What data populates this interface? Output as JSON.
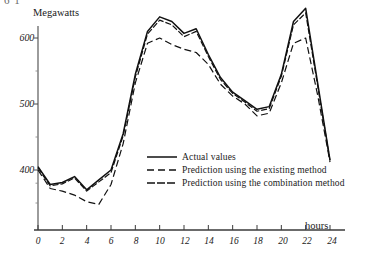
{
  "figure": {
    "crop_artifact_text": "6 1",
    "ylabel": "Megawatts",
    "xlabel": "hours",
    "yticks": [
      "600",
      "500",
      "400"
    ],
    "ytick_values": [
      600,
      500,
      400
    ],
    "xticks": [
      "0",
      "2",
      "4",
      "6",
      "8",
      "10",
      "12",
      "14",
      "16",
      "18",
      "20",
      "22",
      "24"
    ],
    "xtick_values": [
      0,
      2,
      4,
      6,
      8,
      10,
      12,
      14,
      16,
      18,
      20,
      22,
      24
    ],
    "axis_color": "#3a3a3a",
    "line_color": "#111111"
  },
  "legend": {
    "position": "inside-center-right",
    "items": [
      {
        "label": "Actual values",
        "style": "solid",
        "dash": "none"
      },
      {
        "label": "Prediction using the existing method",
        "style": "long-dash",
        "dash": "9,4"
      },
      {
        "label": "Prediction using the combination method",
        "style": "dash",
        "dash": "7,2.5"
      }
    ]
  },
  "chart_data": {
    "type": "line",
    "title": "",
    "xlabel": "hours",
    "ylabel": "Megawatts",
    "xlim": [
      0,
      24
    ],
    "ylim": [
      330,
      660
    ],
    "grid": false,
    "legend_position": "inside-center-right",
    "x": [
      0,
      1,
      2,
      3,
      4,
      5,
      6,
      7,
      8,
      9,
      10,
      11,
      12,
      13,
      14,
      15,
      16,
      17,
      18,
      19,
      20,
      21,
      22,
      23,
      24
    ],
    "series": [
      {
        "name": "Actual values",
        "style": "solid",
        "values": [
          405,
          378,
          381,
          390,
          370,
          385,
          400,
          455,
          545,
          610,
          632,
          625,
          607,
          614,
          575,
          540,
          518,
          505,
          492,
          496,
          545,
          625,
          645,
          530,
          415
        ]
      },
      {
        "name": "Prediction using the existing method",
        "style": "long-dash",
        "values": [
          400,
          372,
          368,
          362,
          352,
          348,
          378,
          440,
          532,
          592,
          600,
          590,
          583,
          578,
          560,
          530,
          512,
          500,
          482,
          486,
          532,
          592,
          600,
          512,
          412
        ]
      },
      {
        "name": "Prediction using the combination method",
        "style": "dash",
        "values": [
          403,
          376,
          379,
          388,
          368,
          382,
          396,
          452,
          541,
          606,
          627,
          620,
          602,
          610,
          572,
          537,
          516,
          503,
          489,
          493,
          542,
          620,
          638,
          526,
          414
        ]
      }
    ]
  }
}
